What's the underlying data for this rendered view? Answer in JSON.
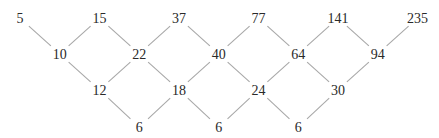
{
  "diagram": {
    "type": "difference-table",
    "rows": [
      {
        "name": "sequence",
        "values": [
          "5",
          "15",
          "37",
          "77",
          "141",
          "235"
        ]
      },
      {
        "name": "first-differences",
        "values": [
          "10",
          "22",
          "40",
          "64",
          "94"
        ]
      },
      {
        "name": "second-differences",
        "values": [
          "12",
          "18",
          "24",
          "30"
        ]
      },
      {
        "name": "third-differences",
        "values": [
          "6",
          "6",
          "6"
        ]
      }
    ],
    "colors": {
      "text": "#2a2a2a",
      "edge": "#a8a8a8"
    }
  }
}
